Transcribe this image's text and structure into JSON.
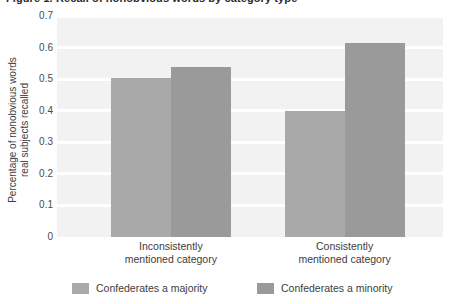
{
  "title": {
    "text": "Figure 1. Recall of nonobvious words by category type",
    "clipped": true
  },
  "chart_data": {
    "type": "bar",
    "title": "",
    "xlabel": "",
    "ylabel": "Percentage of nonobvious words real subjects recalled",
    "ylabel_lines": [
      "Percentage of nonobvious words",
      "real subjects recalled"
    ],
    "categories": [
      "Inconsistently mentioned category",
      "Consistently mentioned category"
    ],
    "category_lines": [
      [
        "Inconsistently",
        "mentioned category"
      ],
      [
        "Consistently",
        "mentioned category"
      ]
    ],
    "series": [
      {
        "name": "Confederates a majority",
        "values": [
          0.505,
          0.4
        ],
        "color": "#a9a9a9"
      },
      {
        "name": "Confederates a minority",
        "values": [
          0.54,
          0.615
        ],
        "color": "#9a9a9a"
      }
    ],
    "ylim": [
      0,
      0.7
    ],
    "yticks": [
      0,
      0.1,
      0.2,
      0.3,
      0.4,
      0.5,
      0.6,
      0.7
    ],
    "ytick_labels": [
      "0",
      "0.1",
      "0.2",
      "0.3",
      "0.4",
      "0.5",
      "0.6",
      "0.7"
    ],
    "grid": true,
    "grid_color": "#ffffff",
    "plot_background": "#f2f2f2",
    "legend_position": "bottom"
  }
}
